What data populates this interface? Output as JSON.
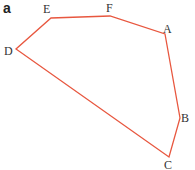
{
  "panel_label": "a",
  "stroke_color": "#e8573f",
  "vertices": [
    {
      "name": "A",
      "x": 165,
      "y": 34,
      "lx": 163,
      "ly": 23
    },
    {
      "name": "B",
      "x": 180,
      "y": 118,
      "lx": 181,
      "ly": 112
    },
    {
      "name": "C",
      "x": 169,
      "y": 157,
      "lx": 164,
      "ly": 159
    },
    {
      "name": "D",
      "x": 16,
      "y": 49,
      "lx": 4,
      "ly": 45
    },
    {
      "name": "E",
      "x": 51,
      "y": 18,
      "lx": 43,
      "ly": 3
    },
    {
      "name": "F",
      "x": 110,
      "y": 16,
      "lx": 106,
      "ly": 2
    }
  ]
}
